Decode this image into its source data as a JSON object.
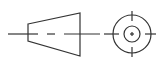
{
  "symbol": {
    "name": "First-angle projection symbol",
    "stroke_color": "#333333",
    "background": "#ffffff"
  },
  "trapezoid": {
    "left_edge": {
      "x": 28,
      "y_top": 24,
      "y_bottom": 41
    },
    "right_edge": {
      "x": 80,
      "y_top": 13,
      "y_bottom": 56
    }
  },
  "centerline": {
    "y": 34,
    "segments": [
      [
        8,
        38
      ],
      [
        47,
        55
      ],
      [
        64,
        100
      ],
      [
        104,
        109
      ]
    ]
  },
  "circles": {
    "center": {
      "x": 132,
      "y": 34
    },
    "outer_radius": 19,
    "inner_radius": 8
  },
  "crosshair": {
    "vertical_top": [
      12,
      20
    ],
    "vertical_bottom": [
      48,
      57
    ],
    "horizontal_left": [
      109,
      120
    ],
    "horizontal_right": [
      144,
      156
    ],
    "center_plus_size": 2
  }
}
